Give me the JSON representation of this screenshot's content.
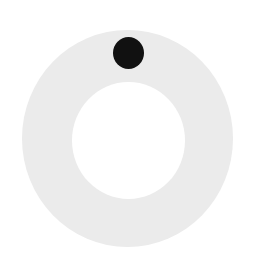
{
  "figure": {
    "colors": {
      "background": "#ffffff",
      "ring": "#ebebeb",
      "hole": "#ffffff",
      "dot": "#111111"
    },
    "ring": {
      "center": [
        127,
        138
      ],
      "outer_radius": 106,
      "inner_radius": 57
    },
    "marker": {
      "center": [
        128,
        53
      ],
      "radius": 16,
      "position": "top"
    }
  }
}
